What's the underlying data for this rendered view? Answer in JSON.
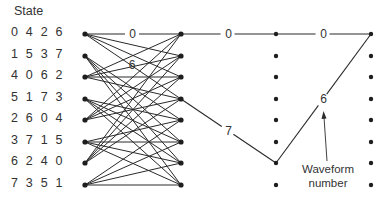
{
  "title": "State",
  "states": [
    "0 4 2 6",
    "1 5 3 7",
    "4 0 6 2",
    "5 1 7 3",
    "2 6 0 4",
    "3 7 1 5",
    "6 2 4 0",
    "7 3 5 1"
  ],
  "trellis": {
    "columns_x": [
      85,
      181,
      276,
      371
    ],
    "rows_y": [
      34,
      56,
      77,
      99,
      120,
      142,
      163,
      185
    ],
    "stage1_connections": {
      "even_states_to": [
        0,
        1,
        2,
        3
      ],
      "odd_states_to": [
        4,
        5,
        6,
        7
      ]
    }
  },
  "path_labels": {
    "stage1_top": "0",
    "stage1_second": "6",
    "stage2_top": "0",
    "stage2_diag": "7",
    "stage3_top": "0",
    "stage3_diag": "6"
  },
  "annotation": {
    "line1": "Waveform",
    "line2": "number"
  },
  "colors": {
    "line": "#2a2a2a",
    "node": "#1e1e1e"
  }
}
